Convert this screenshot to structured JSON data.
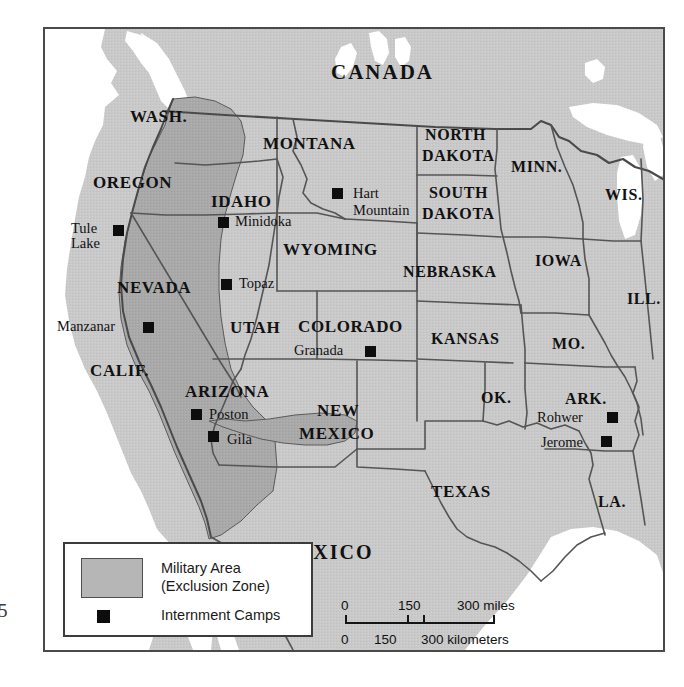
{
  "map": {
    "title_countries": [
      {
        "name": "CANADA",
        "x": 286,
        "y": 33,
        "size": 21
      },
      {
        "name": "MEXICO",
        "x": 232,
        "y": 513,
        "size": 20
      }
    ],
    "states": [
      {
        "name": "WASH.",
        "x": 85,
        "y": 79,
        "size": 17
      },
      {
        "name": "OREGON",
        "x": 48,
        "y": 145,
        "size": 17
      },
      {
        "name": "IDAHO",
        "x": 166,
        "y": 164,
        "size": 17
      },
      {
        "name": "MONTANA",
        "x": 218,
        "y": 106,
        "size": 17
      },
      {
        "name": "NORTH",
        "x": 372,
        "y": 100,
        "size": 16
      },
      {
        "name": "DAKOTA",
        "x": 370,
        "y": 120,
        "size": 16
      },
      {
        "name": "SOUTH",
        "x": 377,
        "y": 158,
        "size": 16
      },
      {
        "name": "DAKOTA",
        "x": 370,
        "y": 178,
        "size": 16
      },
      {
        "name": "MINN.",
        "x": 473,
        "y": 132,
        "size": 16
      },
      {
        "name": "WIS.",
        "x": 578,
        "y": 160,
        "size": 16
      },
      {
        "name": "WYOMING",
        "x": 244,
        "y": 212,
        "size": 17
      },
      {
        "name": "NEBRASKA",
        "x": 364,
        "y": 237,
        "size": 16
      },
      {
        "name": "IOWA",
        "x": 493,
        "y": 225,
        "size": 16
      },
      {
        "name": "ILL.",
        "x": 593,
        "y": 263,
        "size": 16
      },
      {
        "name": "NEVADA",
        "x": 75,
        "y": 250,
        "size": 17
      },
      {
        "name": "UTAH",
        "x": 188,
        "y": 290,
        "size": 17
      },
      {
        "name": "COLORADO",
        "x": 258,
        "y": 289,
        "size": 17
      },
      {
        "name": "KANSAS",
        "x": 391,
        "y": 303,
        "size": 16
      },
      {
        "name": "MO.",
        "x": 513,
        "y": 308,
        "size": 16
      },
      {
        "name": "CALIF.",
        "x": 48,
        "y": 334,
        "size": 17
      },
      {
        "name": "ARIZONA",
        "x": 144,
        "y": 355,
        "size": 17
      },
      {
        "name": "NEW",
        "x": 272,
        "y": 375,
        "size": 17
      },
      {
        "name": "MEXICO",
        "x": 258,
        "y": 397,
        "size": 17
      },
      {
        "name": "OK.",
        "x": 440,
        "y": 362,
        "size": 16
      },
      {
        "name": "ARK.",
        "x": 524,
        "y": 363,
        "size": 16
      },
      {
        "name": "TEXAS",
        "x": 392,
        "y": 455,
        "size": 17
      },
      {
        "name": "LA.",
        "x": 560,
        "y": 466,
        "size": 16
      }
    ],
    "camps": [
      {
        "name": "Tule\nLake",
        "label_x": 30,
        "label_y": 196,
        "sq_x": 66,
        "sq_y": 197,
        "label_align": "right",
        "size": 14
      },
      {
        "name": "Manzanar",
        "label_x": 14,
        "label_y": 294,
        "sq_x": 97,
        "sq_y": 296,
        "label_align": "left",
        "size": 14
      },
      {
        "name": "Minidoka",
        "label_x": 190,
        "label_y": 188,
        "sq_x": 172,
        "sq_y": 190,
        "label_align": "left",
        "size": 14
      },
      {
        "name": "Hart\nMountain",
        "label_x": 310,
        "label_y": 160,
        "sq_x": 286,
        "sq_y": 162,
        "label_align": "left",
        "size": 14
      },
      {
        "name": "Topaz",
        "label_x": 192,
        "label_y": 250,
        "sq_x": 172,
        "sq_y": 252,
        "label_align": "left",
        "size": 14
      },
      {
        "name": "Granada",
        "label_x": 250,
        "label_y": 318,
        "sq_x": 357,
        "sq_y": 321,
        "label_align": "left",
        "size": 14
      },
      {
        "name": "Poston",
        "label_x": 163,
        "label_y": 381,
        "sq_x": 143,
        "sq_y": 383,
        "label_align": "left",
        "size": 14
      },
      {
        "name": "Gila",
        "label_x": 180,
        "label_y": 407,
        "sq_x": 160,
        "sq_y": 406,
        "label_align": "left",
        "size": 14
      },
      {
        "name": "Rohwer",
        "label_x": 488,
        "label_y": 385,
        "sq_x": 570,
        "sq_y": 387,
        "label_align": "left",
        "size": 14
      },
      {
        "name": "Jerome",
        "label_x": 490,
        "label_y": 410,
        "sq_x": 558,
        "sq_y": 411,
        "label_align": "left",
        "size": 14
      }
    ]
  },
  "legend": {
    "area_label_line1": "Military Area",
    "area_label_line2": "(Exclusion Zone)",
    "camps_label": "Internment Camps"
  },
  "scale": {
    "miles": {
      "ticks": [
        "0",
        "150",
        "300 miles"
      ]
    },
    "kilometers": {
      "ticks": [
        "0",
        "150",
        "300 kilometers"
      ]
    }
  },
  "page_number": "5",
  "colors": {
    "land": "#c8c8c8",
    "exclusion_zone": "#a8a8a8",
    "water": "#ffffff",
    "border": "#4a4a4a",
    "camp_marker": "#0d0d0d",
    "text": "#111111"
  }
}
